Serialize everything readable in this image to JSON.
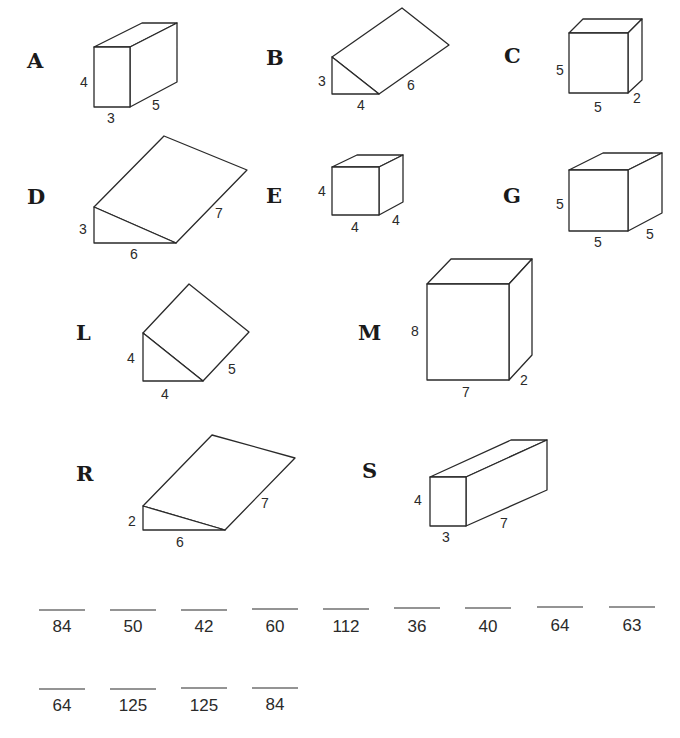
{
  "shapes": [
    {
      "letter": "A",
      "type": "rectangular-prism",
      "dims": [
        "4",
        "3",
        "5"
      ]
    },
    {
      "letter": "B",
      "type": "triangular-prism",
      "dims": [
        "3",
        "4",
        "6"
      ]
    },
    {
      "letter": "C",
      "type": "rectangular-prism",
      "dims": [
        "5",
        "5",
        "2"
      ]
    },
    {
      "letter": "D",
      "type": "triangular-prism",
      "dims": [
        "3",
        "6",
        "7"
      ]
    },
    {
      "letter": "E",
      "type": "rectangular-prism",
      "dims": [
        "4",
        "4",
        "4"
      ]
    },
    {
      "letter": "G",
      "type": "rectangular-prism",
      "dims": [
        "5",
        "5",
        "5"
      ]
    },
    {
      "letter": "L",
      "type": "triangular-prism",
      "dims": [
        "4",
        "4",
        "5"
      ]
    },
    {
      "letter": "M",
      "type": "rectangular-prism",
      "dims": [
        "8",
        "7",
        "2"
      ]
    },
    {
      "letter": "R",
      "type": "triangular-prism",
      "dims": [
        "2",
        "6",
        "7"
      ]
    },
    {
      "letter": "S",
      "type": "rectangular-prism",
      "dims": [
        "4",
        "3",
        "7"
      ]
    }
  ],
  "answers_row1": [
    "84",
    "50",
    "42",
    "60",
    "112",
    "36",
    "40",
    "64",
    "63"
  ],
  "answers_row2": [
    "64",
    "125",
    "125",
    "84"
  ]
}
